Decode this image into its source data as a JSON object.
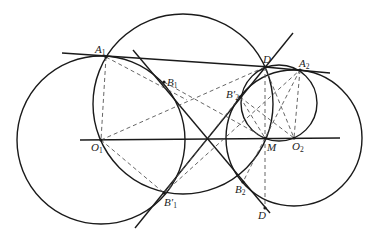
{
  "caption_fragment": "",
  "labels": {
    "A1": {
      "base": "A",
      "sub": "1"
    },
    "B1": {
      "base": "B",
      "sub": "1"
    },
    "D_top": {
      "base": "D",
      "sub": ""
    },
    "A2": {
      "base": "A",
      "sub": "2"
    },
    "B2prime": {
      "base": "B′",
      "sub": "2"
    },
    "O1": {
      "base": "O",
      "sub": "1"
    },
    "M": {
      "base": "M",
      "sub": ""
    },
    "O2": {
      "base": "O",
      "sub": "2"
    },
    "B1prime": {
      "base": "B′",
      "sub": "1"
    },
    "B2": {
      "base": "B",
      "sub": "2"
    },
    "D_bottom": {
      "base": "D",
      "sub": ""
    }
  },
  "colors": {
    "stroke": "#1a1a1a",
    "dash": "#555555",
    "background": "#ffffff"
  }
}
